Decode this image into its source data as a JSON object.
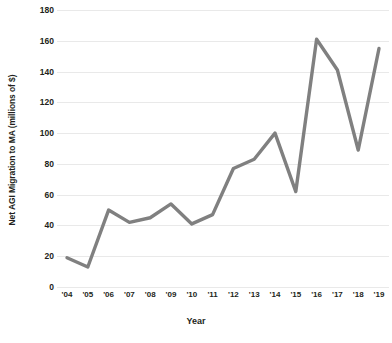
{
  "chart_data": {
    "type": "line",
    "title": "",
    "xlabel": "Year",
    "ylabel": "Net AGI Migration to MA (millions of $)",
    "categories": [
      "'04",
      "'05",
      "'06",
      "'07",
      "'08",
      "'09",
      "'10",
      "'11",
      "'12",
      "'13",
      "'14",
      "'15",
      "'16",
      "'17",
      "'18",
      "'19"
    ],
    "x_values": [
      2004,
      2005,
      2006,
      2007,
      2008,
      2009,
      2010,
      2011,
      2012,
      2013,
      2014,
      2015,
      2016,
      2017,
      2018,
      2019
    ],
    "values": [
      19,
      13,
      50,
      42,
      45,
      54,
      41,
      47,
      77,
      83,
      100,
      62,
      161,
      141,
      89,
      155
    ],
    "ylim": [
      0,
      180
    ],
    "yticks": [
      0,
      20,
      40,
      60,
      80,
      100,
      120,
      140,
      160,
      180
    ],
    "ytick_labels": [
      "0",
      "20",
      "40",
      "60",
      "80",
      "100",
      "120",
      "140",
      "160",
      "180"
    ],
    "grid": true,
    "legend": "none",
    "series": [
      {
        "name": "Net AGI Migration to MA",
        "color": "#808080",
        "values": [
          19,
          13,
          50,
          42,
          45,
          54,
          41,
          47,
          77,
          83,
          100,
          62,
          161,
          141,
          89,
          155
        ]
      }
    ],
    "line_color": "#808080",
    "line_width": 3.4,
    "grid_color": "#e9e9e9",
    "text_color": "#231f20",
    "background": "#ffffff"
  }
}
